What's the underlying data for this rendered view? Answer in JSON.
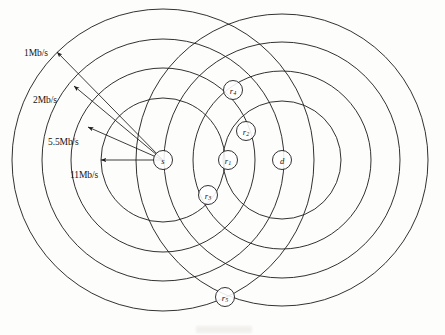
{
  "figure": {
    "type": "network-coverage-diagram",
    "width": 445,
    "height": 335,
    "background_color": "#fdfdfc",
    "line_color": "#1b1b1b"
  },
  "rate_labels": [
    {
      "id": "rate-1mbs",
      "text": "1Mb/s",
      "x": 24,
      "y": 48
    },
    {
      "id": "rate-2mbs",
      "text": "2Mb/s",
      "x": 33,
      "y": 95
    },
    {
      "id": "rate-55mbs",
      "text": "5.5Mb/s",
      "x": 48,
      "y": 137
    },
    {
      "id": "rate-11mbs",
      "text": "11Mb/s",
      "x": 70,
      "y": 170
    }
  ],
  "nodes": [
    {
      "id": "node-s",
      "label": "s",
      "sub": "",
      "x": 163,
      "y": 160,
      "r": 9.5
    },
    {
      "id": "node-r1",
      "label": "r",
      "sub": "1",
      "x": 228,
      "y": 160,
      "r": 9.5
    },
    {
      "id": "node-r2",
      "label": "r",
      "sub": "2",
      "x": 246,
      "y": 131,
      "r": 9.5
    },
    {
      "id": "node-r3",
      "label": "r",
      "sub": "3",
      "x": 208,
      "y": 195,
      "r": 9.5
    },
    {
      "id": "node-r4",
      "label": "r",
      "sub": "4",
      "x": 233,
      "y": 90,
      "r": 9.5
    },
    {
      "id": "node-r5",
      "label": "r",
      "sub": "5",
      "x": 225,
      "y": 297,
      "r": 9.5
    },
    {
      "id": "node-d",
      "label": "d",
      "sub": "",
      "x": 282,
      "y": 160,
      "r": 9.5
    }
  ],
  "source_rings": {
    "center_x": 163,
    "center_y": 160,
    "radii": [
      62,
      92,
      121,
      151
    ]
  },
  "destination_rings": {
    "center_x": 282,
    "center_y": 160,
    "radii": [
      59,
      89,
      118,
      146
    ]
  },
  "rate_arrows": [
    {
      "id": "arrow-1mbs",
      "from_x": 163,
      "from_y": 160,
      "to_x": 57,
      "to_y": 52,
      "rate": "1Mb/s"
    },
    {
      "id": "arrow-2mbs",
      "from_x": 163,
      "from_y": 160,
      "to_x": 74,
      "to_y": 86,
      "rate": "2Mb/s"
    },
    {
      "id": "arrow-55mbs",
      "from_x": 163,
      "from_y": 160,
      "to_x": 88,
      "to_y": 127,
      "rate": "5.5Mb/s"
    },
    {
      "id": "arrow-11mbs",
      "from_x": 163,
      "from_y": 160,
      "to_x": 101,
      "to_y": 160,
      "rate": "11Mb/s"
    }
  ]
}
